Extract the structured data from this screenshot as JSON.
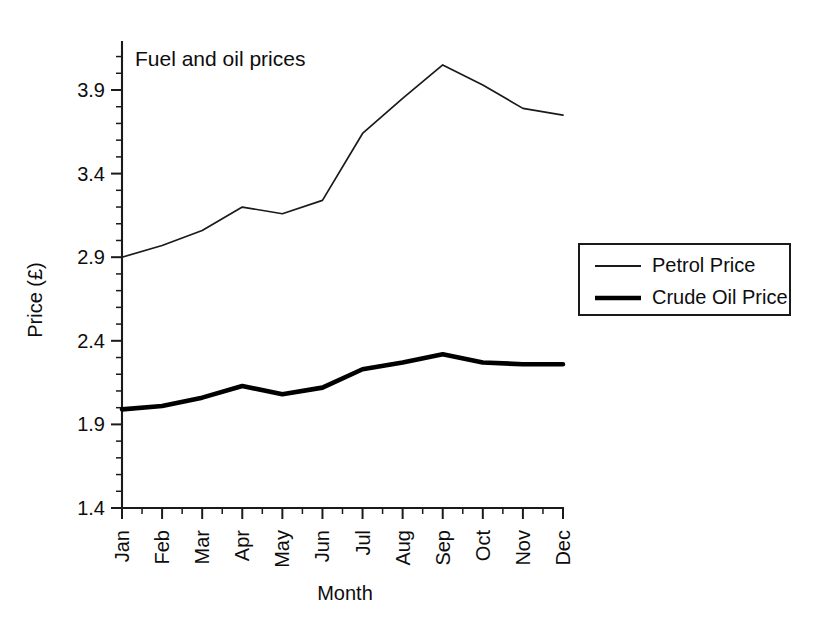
{
  "chart_data": {
    "type": "line",
    "title": "Fuel and oil prices",
    "xlabel": "Month",
    "ylabel": "Price (£)",
    "categories": [
      "Jan",
      "Feb",
      "Mar",
      "Apr",
      "May",
      "Jun",
      "Jul",
      "Aug",
      "Sep",
      "Oct",
      "Nov",
      "Dec"
    ],
    "ylim": [
      1.4,
      4.15
    ],
    "ytick_labels": [
      "1.4",
      "1.9",
      "2.4",
      "2.9",
      "3.4",
      "3.9"
    ],
    "ytick_values": [
      1.4,
      1.9,
      2.4,
      2.9,
      3.4,
      3.9
    ],
    "yminor_step": 0.1,
    "grid": false,
    "legend_position": "right",
    "series": [
      {
        "name": "Petrol Price",
        "line_style": "thin",
        "color": "#1a1a1a",
        "values": [
          2.9,
          2.97,
          3.06,
          3.2,
          3.16,
          3.24,
          3.64,
          3.85,
          4.05,
          3.93,
          3.79,
          3.75
        ]
      },
      {
        "name": "Crude Oil Price",
        "line_style": "thick",
        "color": "#000000",
        "values": [
          1.99,
          2.01,
          2.06,
          2.13,
          2.08,
          2.12,
          2.23,
          2.27,
          2.32,
          2.27,
          2.26,
          2.26
        ]
      }
    ]
  },
  "legend": {
    "entries": [
      "Petrol Price",
      "Crude Oil Price"
    ]
  }
}
